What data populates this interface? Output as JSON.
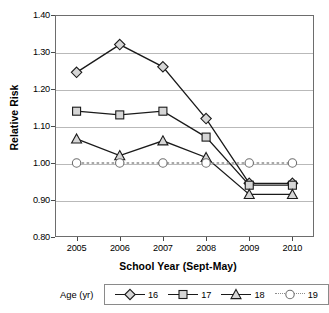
{
  "chart_data": {
    "type": "line",
    "title": "",
    "xlabel": "School Year (Sept-May)",
    "ylabel": "Relative Risk",
    "categories": [
      "2005",
      "2006",
      "2007",
      "2008",
      "2009",
      "2010"
    ],
    "ylim": [
      0.8,
      1.4
    ],
    "yticks": [
      "0.80",
      "0.90",
      "1.00",
      "1.10",
      "1.20",
      "1.30",
      "1.40"
    ],
    "ytick_values": [
      0.8,
      0.9,
      1.0,
      1.1,
      1.2,
      1.3,
      1.4
    ],
    "grid": true,
    "grid_axis": "y",
    "legend_position": "bottom",
    "legend_title": "Age (yr)",
    "series": [
      {
        "name": "16",
        "marker": "diamond",
        "linestyle": "solid",
        "color": "#1a1a1a",
        "marker_fill": "#d6d6d6",
        "values": [
          1.245,
          1.32,
          1.26,
          1.12,
          0.945,
          0.945
        ]
      },
      {
        "name": "17",
        "marker": "square",
        "linestyle": "solid",
        "color": "#1a1a1a",
        "marker_fill": "#d6d6d6",
        "values": [
          1.14,
          1.13,
          1.14,
          1.07,
          0.94,
          0.94
        ]
      },
      {
        "name": "18",
        "marker": "triangle",
        "linestyle": "solid",
        "color": "#1a1a1a",
        "marker_fill": "#d6d6d6",
        "values": [
          1.065,
          1.02,
          1.06,
          1.015,
          0.915,
          0.915
        ]
      },
      {
        "name": "19",
        "marker": "circle",
        "linestyle": "dotted",
        "color": "#8d8d8d",
        "marker_fill": "#ffffff",
        "values": [
          1.0,
          1.0,
          1.0,
          1.0,
          1.0,
          1.0
        ]
      }
    ]
  },
  "axes": {
    "y_title": "Relative Risk",
    "x_title": "School Year (Sept-May)"
  },
  "legend": {
    "title": "Age (yr)",
    "items": [
      {
        "label": "16"
      },
      {
        "label": "17"
      },
      {
        "label": "18"
      },
      {
        "label": "19"
      }
    ]
  },
  "colors": {
    "frame": "#6d6d6d",
    "grid": "#b9b9b9",
    "line": "#1a1a1a",
    "marker_fill": "#d6d6d6",
    "reference_line": "#8d8d8d"
  }
}
